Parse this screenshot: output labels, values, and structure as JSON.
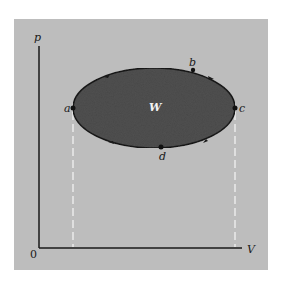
{
  "diagram": {
    "type": "pV cycle diagram",
    "axes": {
      "y_label": "p",
      "x_label": "V",
      "origin_label": "0"
    },
    "region_label": "W",
    "points": [
      {
        "label": "a",
        "x": 73,
        "y": 108
      },
      {
        "label": "b",
        "x": 193,
        "y": 70
      },
      {
        "label": "c",
        "x": 235,
        "y": 108
      },
      {
        "label": "d",
        "x": 161,
        "y": 147
      }
    ],
    "cycle_direction": "clockwise",
    "colors": {
      "background": "#bdbdbd",
      "fill": "#505050",
      "stroke": "#1a1a1a",
      "dashed": "#f2f2f2"
    }
  }
}
